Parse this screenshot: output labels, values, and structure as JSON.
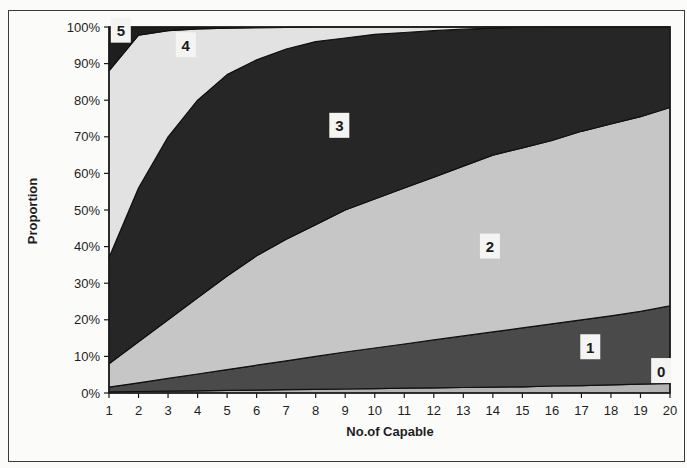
{
  "chart_data": {
    "type": "area",
    "stacked": "percent",
    "title": "",
    "xlabel": "No.of Capable",
    "ylabel": "Proportion",
    "x": [
      1,
      2,
      3,
      4,
      5,
      6,
      7,
      8,
      9,
      10,
      11,
      12,
      13,
      14,
      15,
      16,
      17,
      18,
      19,
      20
    ],
    "ylim": [
      0,
      100
    ],
    "yticks": [
      "0%",
      "10%",
      "20%",
      "30%",
      "40%",
      "50%",
      "60%",
      "70%",
      "80%",
      "90%",
      "100%"
    ],
    "xticks": [
      "1",
      "2",
      "3",
      "4",
      "5",
      "6",
      "7",
      "8",
      "9",
      "10",
      "11",
      "12",
      "13",
      "14",
      "15",
      "16",
      "17",
      "18",
      "19",
      "20"
    ],
    "grid": false,
    "legend": "none (inline area labels)",
    "series": [
      {
        "name": "0",
        "color": "#b4b4b4",
        "values": [
          0.3,
          0.4,
          0.5,
          0.6,
          0.7,
          0.8,
          0.9,
          1.0,
          1.1,
          1.2,
          1.3,
          1.4,
          1.5,
          1.6,
          1.7,
          1.9,
          2.0,
          2.2,
          2.4,
          2.6
        ]
      },
      {
        "name": "1",
        "color": "#4a4a4a",
        "values": [
          1.3,
          2.4,
          3.5,
          4.6,
          5.7,
          6.8,
          7.9,
          9.0,
          10.1,
          11.1,
          12.1,
          13.1,
          14.1,
          15.1,
          16.1,
          17.0,
          18.0,
          18.9,
          19.9,
          21.2
        ]
      },
      {
        "name": "2",
        "color": "#c6c6c6",
        "values": [
          6.4,
          11.2,
          16.0,
          20.8,
          25.6,
          29.9,
          33.2,
          36.0,
          38.8,
          40.7,
          42.6,
          44.5,
          46.4,
          48.3,
          49.2,
          50.1,
          51.5,
          52.4,
          53.2,
          54.2
        ]
      },
      {
        "name": "3",
        "color": "#262626",
        "values": [
          29.0,
          42.0,
          50.0,
          54.0,
          55.0,
          53.5,
          52.0,
          50.0,
          47.0,
          45.0,
          42.5,
          40.0,
          37.4,
          34.7,
          32.9,
          31.0,
          28.5,
          26.5,
          24.5,
          22.0
        ]
      },
      {
        "name": "4",
        "color": "#e2e2e2",
        "values": [
          51.0,
          41.8,
          29.0,
          19.5,
          12.7,
          8.8,
          5.9,
          4.0,
          3.0,
          2.0,
          1.5,
          1.0,
          0.6,
          0.3,
          0.1,
          0,
          0,
          0,
          0,
          0
        ]
      },
      {
        "name": "5",
        "color": "#1e1e1e",
        "values": [
          12.0,
          2.2,
          1.0,
          0.5,
          0.3,
          0.2,
          0.1,
          0,
          0,
          0,
          0,
          0,
          0,
          0,
          0,
          0,
          0,
          0,
          0,
          0
        ]
      }
    ],
    "annotations": [
      {
        "text": "5",
        "x": 1.4,
        "y": 99
      },
      {
        "text": "4",
        "x": 3.6,
        "y": 95
      },
      {
        "text": "3",
        "x": 8.8,
        "y": 73
      },
      {
        "text": "2",
        "x": 13.9,
        "y": 40
      },
      {
        "text": "1",
        "x": 17.3,
        "y": 12.5
      },
      {
        "text": "0",
        "x": 19.7,
        "y": 6
      }
    ]
  }
}
